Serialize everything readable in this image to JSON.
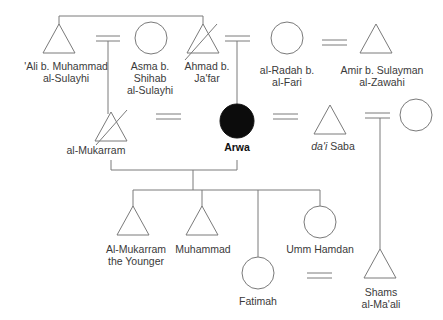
{
  "diagram": {
    "colors": {
      "line": "#7a7a7a",
      "ego_fill": "#0c0c0c",
      "text": "#3a3a3a"
    },
    "people": [
      {
        "id": "ali",
        "name_line1": "'Ali b. Muhammad",
        "name_line2": "al-Sulayhi",
        "sex": "male",
        "deceased": false
      },
      {
        "id": "asma",
        "name_line1": "Asma b.",
        "name_line2": "Shihab",
        "name_line3": "al-Sulayhi",
        "sex": "female",
        "deceased": false
      },
      {
        "id": "ahmad",
        "name_line1": "Ahmad b.",
        "name_line2": "Ja'far",
        "sex": "male",
        "deceased": true
      },
      {
        "id": "radah",
        "name_line1": "al-Radah b.",
        "name_line2": "al-Fari",
        "sex": "female",
        "deceased": false
      },
      {
        "id": "amir",
        "name_line1": "Amir b. Sulayman",
        "name_line2": "al-Zawahi",
        "sex": "male",
        "deceased": false
      },
      {
        "id": "mukarram",
        "name_line1": "al-Mukarram",
        "sex": "male",
        "deceased": true
      },
      {
        "id": "arwa",
        "name_line1": "Arwa",
        "sex": "female",
        "ego": true
      },
      {
        "id": "dai_saba",
        "name_prefix_italic": "da'i",
        "name_line1": "Saba",
        "sex": "male",
        "deceased": false
      },
      {
        "id": "saba_wife",
        "name_line1": "",
        "sex": "female",
        "deceased": false
      },
      {
        "id": "mukarram_younger",
        "name_line1": "Al-Mukarram",
        "name_line2": "the Younger",
        "sex": "male"
      },
      {
        "id": "muhammad",
        "name_line1": "Muhammad",
        "sex": "male"
      },
      {
        "id": "fatimah",
        "name_line1": "Fatimah",
        "sex": "female"
      },
      {
        "id": "umm_hamdan",
        "name_line1": "Umm Hamdan",
        "sex": "female"
      },
      {
        "id": "shams",
        "name_line1": "Shams",
        "name_line2": "al-Ma'ali",
        "sex": "male"
      }
    ],
    "marriages": [
      [
        "ali",
        "asma"
      ],
      [
        "ahmad",
        "radah"
      ],
      [
        "radah",
        "amir"
      ],
      [
        "mukarram",
        "arwa"
      ],
      [
        "arwa",
        "dai_saba"
      ],
      [
        "dai_saba",
        "saba_wife"
      ],
      [
        "fatimah",
        "shams"
      ]
    ],
    "siblings": [
      [
        "ali",
        "ahmad"
      ]
    ]
  }
}
